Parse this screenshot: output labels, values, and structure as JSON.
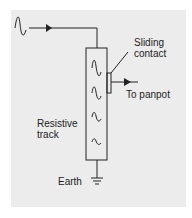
{
  "diagram": {
    "type": "potentiometer-schematic",
    "labels": {
      "sliding_contact_line1": "Sliding",
      "sliding_contact_line2": "contact",
      "output": "To panpot",
      "track_line1": "Resistive",
      "track_line2": "track",
      "ground": "Earth"
    },
    "components": [
      {
        "name": "input-signal",
        "icon": "sine-wave"
      },
      {
        "name": "resistive-track",
        "waves": 4
      },
      {
        "name": "sliding-contact"
      },
      {
        "name": "output-arrow"
      },
      {
        "name": "earth-ground",
        "icon": "ground-symbol"
      }
    ],
    "colors": {
      "background": "#ffffff",
      "panel": "#ececec",
      "stroke": "#222222"
    }
  }
}
